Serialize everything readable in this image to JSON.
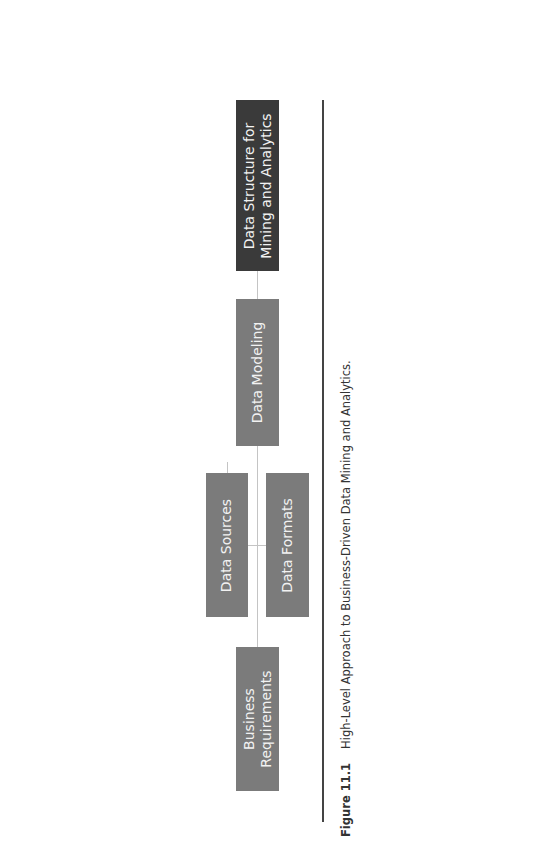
{
  "diagram": {
    "nodes": [
      {
        "id": "business-requirements",
        "label": "Business\nRequirements",
        "color": "#7b7b7b"
      },
      {
        "id": "data-sources",
        "label": "Data Sources",
        "color": "#7b7b7b"
      },
      {
        "id": "data-formats",
        "label": "Data Formats",
        "color": "#7b7b7b"
      },
      {
        "id": "data-modeling",
        "label": "Data Modeling",
        "color": "#7b7b7b"
      },
      {
        "id": "data-structure",
        "label": "Data Structure for\nMining and Analytics",
        "color": "#3a3a3a"
      }
    ],
    "edges": [
      {
        "from": "business-requirements",
        "to": "data-sources"
      },
      {
        "from": "business-requirements",
        "to": "data-formats"
      },
      {
        "from": "data-sources",
        "to": "data-modeling"
      },
      {
        "from": "data-formats",
        "to": "data-modeling"
      },
      {
        "from": "data-modeling",
        "to": "data-structure"
      }
    ],
    "orientation": "rotated-90-ccw"
  },
  "caption": {
    "number": "Figure 11.1",
    "text": "High-Level Approach to Business-Driven Data Mining and Analytics."
  }
}
